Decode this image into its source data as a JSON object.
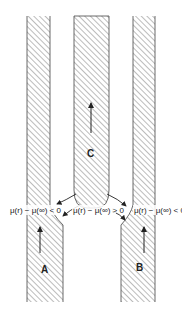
{
  "diagram": {
    "type": "grain-boundary / column growth schematic",
    "columns": [
      {
        "id": "A",
        "label": "A",
        "growth_direction": "up"
      },
      {
        "id": "B",
        "label": "B",
        "growth_direction": "up"
      },
      {
        "id": "C",
        "label": "C",
        "growth_direction": "up"
      }
    ],
    "annotations": {
      "left": "μ(r) − μ(∞) < 0",
      "middle": "μ(r) − μ(∞) > 0",
      "right": "μ(r) − μ(∞) < 0"
    },
    "colors": {
      "hatch": "#555555",
      "outline": "#444444",
      "background": "#ffffff",
      "text": "#222222"
    }
  }
}
